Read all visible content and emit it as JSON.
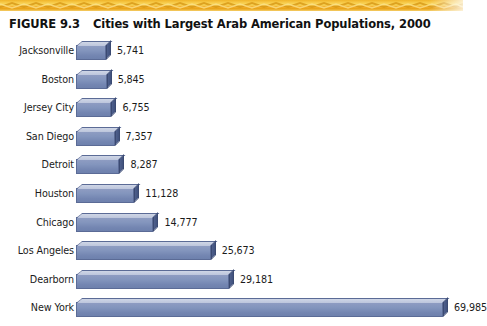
{
  "decor": {
    "top_band_name": "decorative-zigzag-band",
    "band_colors": [
      "#f0b429",
      "#f7c948",
      "#fadb5f",
      "#e8a317"
    ]
  },
  "figure": {
    "number": "FIGURE 9.3",
    "title": "Cities with Largest Arab American Populations, 2000"
  },
  "chart_data": {
    "type": "bar",
    "orientation": "horizontal",
    "title": "Cities with Largest Arab American Populations, 2000",
    "xlabel": "",
    "ylabel": "",
    "xlim": [
      0,
      69985
    ],
    "grid": false,
    "legend": false,
    "bar_color": "#8395bd",
    "bar_top_color": "#c6cee0",
    "bar_side_color": "#475887",
    "categories": [
      "Jacksonville",
      "Boston",
      "Jersey City",
      "San Diego",
      "Detroit",
      "Houston",
      "Chicago",
      "Los Angeles",
      "Dearborn",
      "New York"
    ],
    "values": [
      5741,
      5845,
      6755,
      7357,
      8287,
      11128,
      14777,
      25673,
      29181,
      69985
    ],
    "value_labels": [
      "5,741",
      "5,845",
      "6,755",
      "7,357",
      "8,287",
      "11,128",
      "14,777",
      "25,673",
      "29,181",
      "69,985"
    ]
  }
}
